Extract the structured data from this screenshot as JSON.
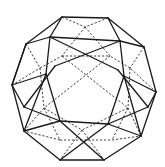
{
  "figure": {
    "colors": {
      "background": "#ffffff",
      "stroke": "#1a1a1a"
    },
    "solid_edges": [
      [
        62,
        17,
        108,
        18
      ],
      [
        108,
        18,
        144,
        47
      ],
      [
        144,
        47,
        156,
        92
      ],
      [
        156,
        92,
        141,
        136
      ],
      [
        141,
        136,
        104,
        160
      ],
      [
        104,
        160,
        60,
        160
      ],
      [
        60,
        160,
        24,
        131
      ],
      [
        24,
        131,
        12,
        85
      ],
      [
        12,
        85,
        26,
        44
      ],
      [
        26,
        44,
        62,
        17
      ],
      [
        26,
        44,
        50,
        37
      ],
      [
        62,
        17,
        50,
        37
      ],
      [
        108,
        18,
        120,
        41
      ],
      [
        144,
        47,
        120,
        41
      ],
      [
        50,
        37,
        120,
        41
      ],
      [
        50,
        37,
        46,
        74
      ],
      [
        120,
        41,
        124,
        76
      ],
      [
        26,
        44,
        12,
        85
      ],
      [
        12,
        85,
        46,
        74
      ],
      [
        46,
        74,
        24,
        131
      ],
      [
        156,
        92,
        124,
        76
      ],
      [
        124,
        76,
        141,
        136
      ],
      [
        24,
        131,
        60,
        121
      ],
      [
        60,
        121,
        104,
        160
      ],
      [
        60,
        121,
        108,
        124
      ],
      [
        108,
        124,
        141,
        136
      ],
      [
        108,
        124,
        60,
        160
      ],
      [
        50,
        37,
        118,
        70
      ],
      [
        120,
        41,
        55,
        66
      ],
      [
        46,
        74,
        60,
        121
      ],
      [
        124,
        76,
        108,
        124
      ],
      [
        55,
        66,
        24,
        107
      ],
      [
        118,
        70,
        148,
        107
      ],
      [
        24,
        107,
        12,
        85
      ],
      [
        148,
        107,
        156,
        92
      ],
      [
        24,
        107,
        60,
        121
      ],
      [
        148,
        107,
        108,
        124
      ]
    ],
    "dashed_edges": [
      [
        62,
        17,
        85,
        27
      ],
      [
        108,
        18,
        85,
        27
      ],
      [
        85,
        27,
        62,
        56
      ],
      [
        85,
        27,
        110,
        56
      ],
      [
        62,
        56,
        110,
        56
      ],
      [
        26,
        44,
        40,
        68
      ],
      [
        144,
        47,
        130,
        68
      ],
      [
        12,
        85,
        40,
        68
      ],
      [
        156,
        92,
        130,
        68
      ],
      [
        40,
        68,
        62,
        56
      ],
      [
        130,
        68,
        110,
        56
      ],
      [
        40,
        68,
        44,
        108
      ],
      [
        130,
        68,
        128,
        108
      ],
      [
        44,
        108,
        24,
        131
      ],
      [
        128,
        108,
        141,
        136
      ],
      [
        44,
        108,
        82,
        130
      ],
      [
        128,
        108,
        82,
        130
      ],
      [
        82,
        130,
        60,
        160
      ],
      [
        82,
        130,
        104,
        160
      ],
      [
        62,
        56,
        128,
        108
      ],
      [
        110,
        56,
        44,
        108
      ],
      [
        44,
        108,
        60,
        140
      ],
      [
        128,
        108,
        112,
        140
      ],
      [
        60,
        140,
        112,
        140
      ],
      [
        60,
        140,
        24,
        131
      ],
      [
        112,
        140,
        141,
        136
      ]
    ]
  }
}
